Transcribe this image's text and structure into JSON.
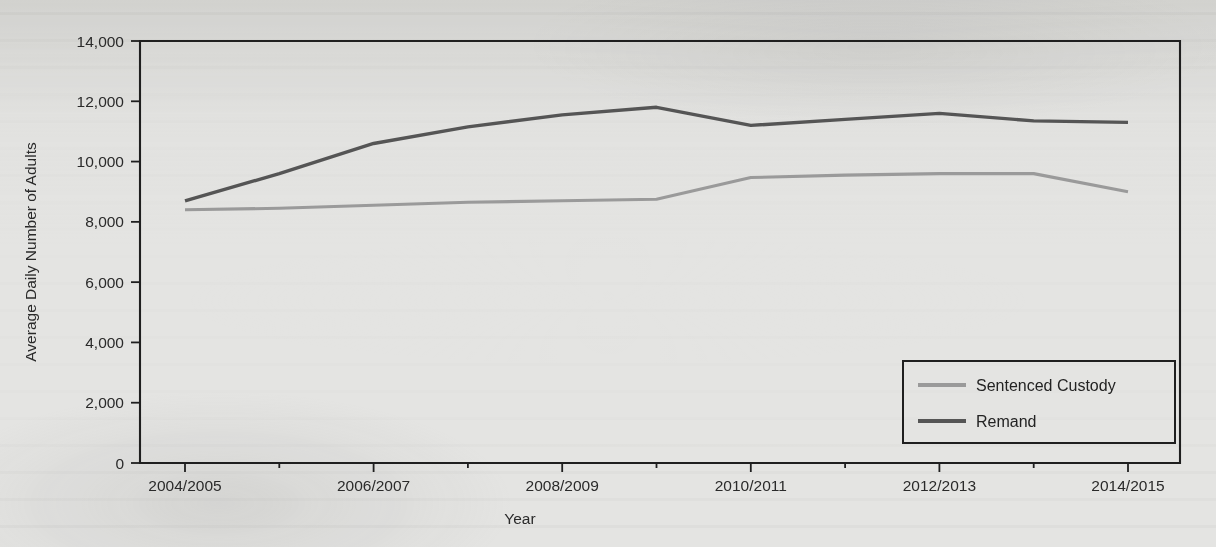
{
  "chart_data": {
    "type": "line",
    "title": "",
    "xlabel": "Year",
    "ylabel": "Average Daily Number of Adults",
    "x": [
      "2004/2005",
      "2005/2006",
      "2006/2007",
      "2007/2008",
      "2008/2009",
      "2009/2010",
      "2010/2011",
      "2011/2012",
      "2012/2013",
      "2013/2014",
      "2014/2015"
    ],
    "x_tick_labels": [
      "2004/2005",
      "2006/2007",
      "2008/2009",
      "2010/2011",
      "2012/2013",
      "2014/2015"
    ],
    "y_tick_labels": [
      "0",
      "2,000",
      "4,000",
      "6,000",
      "8,000",
      "10,000",
      "12,000",
      "14,000"
    ],
    "y_ticks": [
      0,
      2000,
      4000,
      6000,
      8000,
      10000,
      12000,
      14000
    ],
    "ylim": [
      0,
      14000
    ],
    "grid": "off",
    "legend_position": "lower-right-inside",
    "series": [
      {
        "name": "Sentenced Custody",
        "color": "#9a9a9a",
        "values": [
          8400,
          8450,
          8550,
          8650,
          8700,
          8750,
          9470,
          9550,
          9600,
          9600,
          9000
        ]
      },
      {
        "name": "Remand",
        "color": "#555555",
        "values": [
          8700,
          9600,
          10600,
          11150,
          11550,
          11800,
          11200,
          11400,
          11600,
          11350,
          11300
        ]
      }
    ]
  },
  "legend": {
    "items": [
      {
        "label": "Sentenced Custody",
        "swatch_color": "#9a9a9a"
      },
      {
        "label": "Remand",
        "swatch_color": "#555555"
      }
    ]
  },
  "axes": {
    "y_title": "Average Daily Number of Adults",
    "x_title": "Year"
  }
}
